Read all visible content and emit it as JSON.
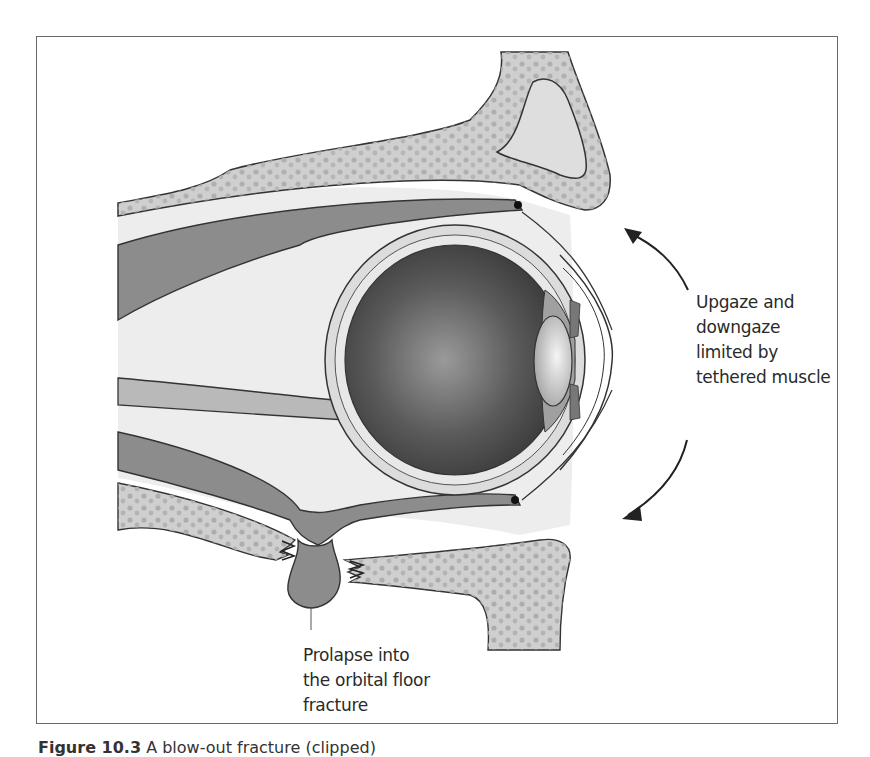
{
  "figure": {
    "type": "anatomical-illustration",
    "labels": {
      "gaze": [
        "Upgaze and",
        "downgaze",
        "limited by",
        "tethered muscle"
      ],
      "prolapse": [
        "Prolapse into",
        "the orbital floor",
        "fracture"
      ]
    },
    "arrows": [
      {
        "name": "upgaze-arrow",
        "direction": "up"
      },
      {
        "name": "downgaze-arrow",
        "direction": "down"
      }
    ],
    "caption": {
      "number": "Figure 10.3",
      "text": "A blow-out fracture (clipped)"
    },
    "colors": {
      "frame": "#6a6a6a",
      "bone": "#cfcfcf",
      "bone_dots": "#a9a9a9",
      "soft_tissue": "#ededed",
      "muscle": "#8c8c8c",
      "optic_nerve": "#b9b9b9",
      "globe_dark": "#3e3e3e",
      "outline": "#333333"
    }
  }
}
